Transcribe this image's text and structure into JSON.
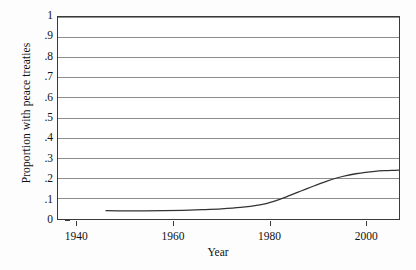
{
  "chart_data": {
    "type": "line",
    "title": "",
    "subtitle": "",
    "xlabel": "Year",
    "ylabel": "Proportion with peace treaties",
    "xlim": [
      1936,
      2007
    ],
    "ylim": [
      0,
      1
    ],
    "grid": true,
    "grid_axis": "y",
    "legend": false,
    "legend_position": "none",
    "xticks": [
      1940,
      1960,
      1980,
      2000
    ],
    "xtick_labels": [
      "1940",
      "1960",
      "1980",
      "2000"
    ],
    "yticks": [
      0,
      0.1,
      0.2,
      0.3,
      0.4,
      0.5,
      0.6,
      0.7,
      0.8,
      0.9,
      1
    ],
    "ytick_labels": [
      "0",
      ".1",
      ".2",
      ".3",
      ".4",
      ".5",
      ".6",
      ".7",
      ".8",
      ".9",
      "1"
    ],
    "series": [
      {
        "name": "Proportion with peace treaties",
        "color": "#333333",
        "line_width": 1.3,
        "x": [
          1946,
          1950,
          1954,
          1958,
          1962,
          1966,
          1970,
          1974,
          1978,
          1980,
          1982,
          1984,
          1986,
          1988,
          1990,
          1992,
          1994,
          1996,
          1998,
          2000,
          2002,
          2004,
          2006,
          2007
        ],
        "y": [
          0.041,
          0.04,
          0.04,
          0.041,
          0.043,
          0.046,
          0.05,
          0.057,
          0.07,
          0.081,
          0.096,
          0.114,
          0.133,
          0.152,
          0.17,
          0.188,
          0.203,
          0.215,
          0.224,
          0.231,
          0.236,
          0.239,
          0.241,
          0.242
        ]
      }
    ],
    "colors": {
      "curve": "#333333",
      "gridline": "#8c8c8c",
      "frame": "#3a3a3a",
      "background": "#ffffff",
      "text": "#111111"
    }
  },
  "axes": {
    "x_title": "Year",
    "y_title": "Proportion with peace treaties"
  }
}
